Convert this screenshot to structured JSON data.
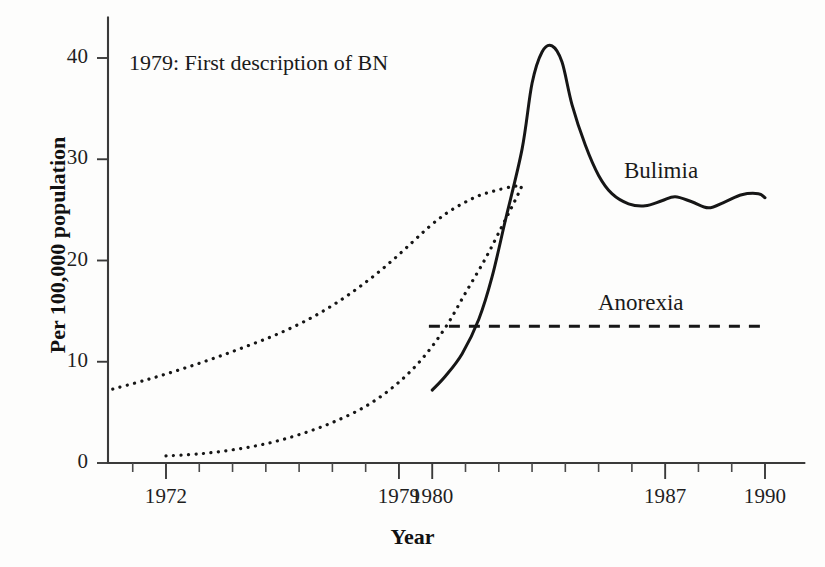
{
  "chart_data": {
    "type": "line",
    "title": "",
    "xlabel": "Year",
    "ylabel": "Per 100,000 population",
    "xlim": [
      1970,
      1991
    ],
    "ylim": [
      0,
      44
    ],
    "grid": false,
    "legend_position": "inline-labels",
    "x_ticks": [
      {
        "value": 1972,
        "label": "1972",
        "major": true
      },
      {
        "value": 1979,
        "label": "1979",
        "major": true
      },
      {
        "value": 1980,
        "label": "1980",
        "major": true
      },
      {
        "value": 1987,
        "label": "1987",
        "major": true
      },
      {
        "value": 1990,
        "label": "1990",
        "major": true
      }
    ],
    "x_minor_ticks": [
      1971,
      1973,
      1974,
      1975,
      1976,
      1977,
      1978,
      1981,
      1982,
      1983,
      1984,
      1985,
      1986,
      1988,
      1989
    ],
    "y_ticks": [
      {
        "value": 0,
        "label": "0"
      },
      {
        "value": 10,
        "label": "10"
      },
      {
        "value": 20,
        "label": "20"
      },
      {
        "value": 30,
        "label": "30"
      },
      {
        "value": 40,
        "label": "40"
      }
    ],
    "annotations": [
      {
        "name": "first-description-note",
        "text": "1979: First description of BN",
        "x": 1971.9,
        "y": 40.8
      }
    ],
    "series": [
      {
        "name": "Bulimia",
        "label": "Bulimia",
        "style": "solid",
        "x": [
          1980.0,
          1980.4,
          1980.9,
          1981.4,
          1981.8,
          1982.2,
          1982.7,
          1983.0,
          1983.3,
          1983.6,
          1983.9,
          1984.2,
          1984.6,
          1985.0,
          1985.4,
          1985.9,
          1986.4,
          1986.9,
          1987.3,
          1987.8,
          1988.3,
          1988.8,
          1989.3,
          1989.8,
          1990.0
        ],
        "y": [
          7.2,
          8.6,
          10.8,
          14.2,
          18.4,
          24.0,
          31.0,
          37.5,
          40.6,
          41.2,
          39.6,
          35.4,
          31.4,
          28.4,
          26.6,
          25.6,
          25.4,
          25.9,
          26.3,
          25.8,
          25.2,
          25.8,
          26.5,
          26.6,
          26.2
        ]
      },
      {
        "name": "Anorexia",
        "label": "Anorexia",
        "style": "dashed",
        "x": [
          1979.9,
          1990.0
        ],
        "y": [
          13.5,
          13.5
        ]
      },
      {
        "name": "Bulimia upper projection",
        "label": "",
        "style": "dotted",
        "x": [
          1970.4,
          1971.4,
          1972.4,
          1973.4,
          1974.4,
          1975.4,
          1976.4,
          1977.3,
          1978.1,
          1978.8,
          1979.4,
          1979.9,
          1980.4,
          1980.9,
          1981.4,
          1981.9,
          1982.4,
          1982.7
        ],
        "y": [
          7.3,
          8.2,
          9.2,
          10.3,
          11.5,
          12.8,
          14.4,
          16.2,
          18.1,
          20.0,
          21.8,
          23.3,
          24.6,
          25.6,
          26.4,
          26.9,
          27.3,
          27.4
        ]
      },
      {
        "name": "Bulimia lower projection",
        "label": "",
        "style": "dotted",
        "x": [
          1972.0,
          1973.0,
          1974.0,
          1975.0,
          1976.0,
          1977.0,
          1978.0,
          1978.9,
          1979.7,
          1980.4,
          1981.0,
          1981.6,
          1982.1,
          1982.5,
          1982.7
        ],
        "y": [
          0.7,
          0.9,
          1.3,
          1.9,
          2.8,
          4.0,
          5.6,
          7.7,
          10.3,
          13.4,
          16.8,
          20.2,
          23.4,
          26.0,
          27.4
        ]
      }
    ]
  },
  "labels": {
    "bulimia": "Bulimia",
    "anorexia": "Anorexia",
    "annotation": "1979: First description of BN",
    "x_title": "Year",
    "y_title": "Per 100,000 population"
  },
  "colors": {
    "line": "#161616",
    "axis": "#3a3a3a",
    "text": "#1a1a1a",
    "background": "#fdfdfc"
  }
}
